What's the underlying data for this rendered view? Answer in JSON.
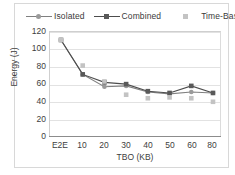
{
  "figure": {
    "background": "#ffffff",
    "border_color": "#d8d8d8"
  },
  "legend": {
    "position": "top",
    "entries": [
      {
        "label": "Isolated",
        "marker": "circle",
        "color": "#9a9a9a",
        "line_color": "#808080",
        "has_line": true
      },
      {
        "label": "Combined",
        "marker": "square",
        "color": "#595959",
        "line_color": "#4d4d4d",
        "has_line": true
      },
      {
        "label": "Time-Based",
        "marker": "square-light",
        "color": "#c3c3c3",
        "line_color": "#c3c3c3",
        "has_line": false
      }
    ]
  },
  "chart_data": {
    "type": "line",
    "title": "",
    "subtitle": "",
    "xlabel": "TBO (KB)",
    "ylabel": "Energy (J)",
    "categories": [
      "E2E",
      "10",
      "20",
      "30",
      "40",
      "50",
      "60",
      "80"
    ],
    "ylim": [
      0,
      120
    ],
    "yticks": [
      0,
      20,
      40,
      60,
      80,
      100,
      120
    ],
    "ytick_labels": [
      "0",
      "20",
      "40",
      "60",
      "80",
      "100",
      "120"
    ],
    "grid": true,
    "grid_axis": "y",
    "legend_position": "top",
    "series": [
      {
        "name": "Isolated",
        "marker": "circle",
        "color": "#9a9a9a",
        "line_color": "#808080",
        "has_line": true,
        "values": [
          111,
          72,
          58,
          59,
          52,
          50,
          52,
          51
        ]
      },
      {
        "name": "Combined",
        "marker": "square",
        "color": "#595959",
        "line_color": "#4d4d4d",
        "has_line": true,
        "values": [
          111,
          72,
          63,
          61,
          53,
          51,
          59,
          51
        ]
      },
      {
        "name": "Time-Based",
        "marker": "square",
        "color": "#c3c3c3",
        "line_color": "#c3c3c3",
        "has_line": false,
        "values": [
          111,
          82,
          64,
          49,
          45,
          46,
          45,
          41
        ]
      }
    ]
  }
}
